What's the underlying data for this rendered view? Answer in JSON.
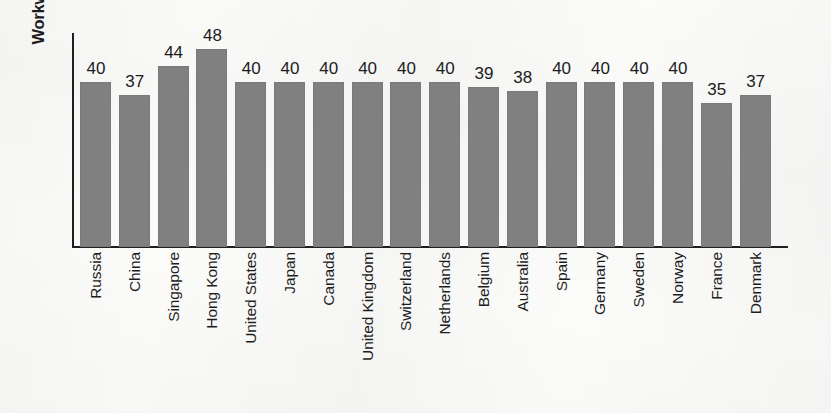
{
  "chart_data": {
    "type": "bar",
    "title": "",
    "subtitle": "",
    "xlabel": "",
    "ylabel": "Workweek (in hours)",
    "ylim": [
      0,
      52
    ],
    "grid": false,
    "legend": "none",
    "bar_color": "#808080",
    "axis_color": "#1f1f1f",
    "text_color": "#1c1c1c",
    "categories": [
      "Russia",
      "China",
      "Singapore",
      "Hong Kong",
      "United States",
      "Japan",
      "Canada",
      "United Kingdom",
      "Switzerland",
      "Netherlands",
      "Belgium",
      "Australia",
      "Spain",
      "Germany",
      "Sweden",
      "Norway",
      "France",
      "Denmark"
    ],
    "values": [
      40,
      37,
      44,
      48,
      40,
      40,
      40,
      40,
      40,
      40,
      39,
      38,
      40,
      40,
      40,
      40,
      35,
      37
    ],
    "value_labels": [
      "40",
      "37",
      "44",
      "48",
      "40",
      "40",
      "40",
      "40",
      "40",
      "40",
      "39",
      "38",
      "40",
      "40",
      "40",
      "40",
      "35",
      "37"
    ]
  }
}
